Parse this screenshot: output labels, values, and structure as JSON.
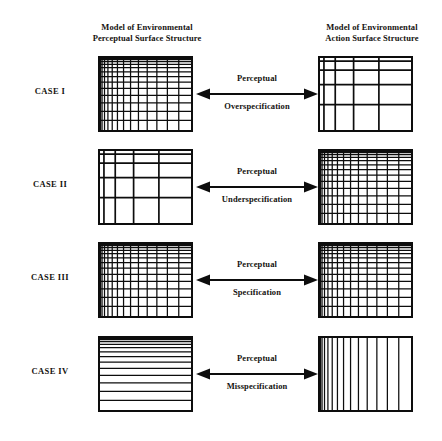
{
  "figure": {
    "headers": {
      "left": {
        "line1": "Model of Environmental",
        "line2": "Perceptual Surface  Structure"
      },
      "right": {
        "line1": "Model of Environmental",
        "line2": "Action Surface  Structure"
      }
    },
    "colors": {
      "line": "#0d0d0d",
      "text": "#15130f",
      "background": "#ffffff"
    },
    "cases": [
      {
        "label": "CASE I",
        "relation": {
          "line1": "Perceptual",
          "line2": "Overspecification",
          "arrow": "double-headed-horizontal-arrow"
        },
        "left_grid": {
          "pattern": "dense",
          "vertical_lines": 13,
          "horizontal_lines": 13
        },
        "right_grid": {
          "pattern": "coarse",
          "vertical_lines": 4,
          "horizontal_lines": 4
        }
      },
      {
        "label": "CASE II",
        "relation": {
          "line1": "Perceptual",
          "line2": "Underspecification",
          "arrow": "double-headed-horizontal-arrow"
        },
        "left_grid": {
          "pattern": "coarse",
          "vertical_lines": 4,
          "horizontal_lines": 4
        },
        "right_grid": {
          "pattern": "dense",
          "vertical_lines": 13,
          "horizontal_lines": 13
        }
      },
      {
        "label": "CASE III",
        "relation": {
          "line1": "Perceptual",
          "line2": "Specification",
          "arrow": "double-headed-horizontal-arrow"
        },
        "left_grid": {
          "pattern": "dense",
          "vertical_lines": 13,
          "horizontal_lines": 13
        },
        "right_grid": {
          "pattern": "dense",
          "vertical_lines": 13,
          "horizontal_lines": 13
        }
      },
      {
        "label": "CASE IV",
        "relation": {
          "line1": "Perceptual",
          "line2": "Misspecification",
          "arrow": "double-headed-horizontal-arrow"
        },
        "left_grid": {
          "pattern": "horizontal-only",
          "vertical_lines": 0,
          "horizontal_lines": 13
        },
        "right_grid": {
          "pattern": "vertical-only",
          "vertical_lines": 13,
          "horizontal_lines": 0
        }
      }
    ]
  }
}
